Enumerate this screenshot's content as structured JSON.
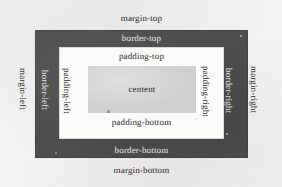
{
  "diagram": {
    "boxes": {
      "margin": {
        "name": "margin-box",
        "color": "#f2f1ef",
        "x": 0,
        "y": 0,
        "width": 282,
        "height": 187
      },
      "border": {
        "name": "border-box",
        "color": "#4d4d4d",
        "x": 35,
        "y": 30,
        "width": 213,
        "height": 128
      },
      "padding": {
        "name": "padding-box",
        "color": "#fbfbfa",
        "x": 59,
        "y": 47,
        "width": 165,
        "height": 92
      },
      "content": {
        "name": "content-box",
        "color": "#cfcfcf",
        "x": 88,
        "y": 66,
        "width": 108,
        "height": 47
      }
    },
    "labels": {
      "margin_top": "margin-top",
      "margin_bottom": "margin-bottom",
      "margin_left": "margin-left",
      "margin_right": "margin-right",
      "border_top": "border-top",
      "border_bottom": "border-bottom",
      "border_left": "border-left",
      "border_right": "border-right",
      "padding_top": "padding-top",
      "padding_bottom": "padding-bottom",
      "padding_left": "padding-left",
      "padding_right": "padding-right",
      "content": "centent"
    }
  }
}
